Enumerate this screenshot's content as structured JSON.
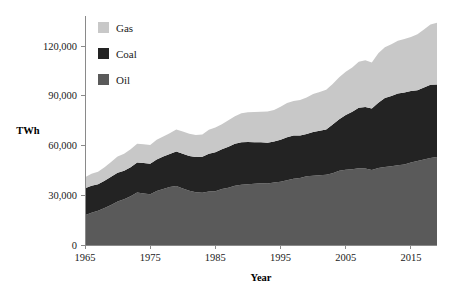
{
  "chart_data": {
    "type": "area",
    "stacked": true,
    "title": "",
    "xlabel": "Year",
    "ylabel": "TWh",
    "xlim": [
      1965,
      2019
    ],
    "ylim": [
      0,
      136000
    ],
    "xticks": [
      1965,
      1975,
      1985,
      1995,
      2005,
      2015
    ],
    "xtick_labels": [
      "1965",
      "1975",
      "1985",
      "1995",
      "2005",
      "2015"
    ],
    "yticks": [
      0,
      30000,
      60000,
      90000,
      120000
    ],
    "ytick_labels": [
      "0",
      "30,000",
      "60,000",
      "90,000",
      "120,000"
    ],
    "grid": false,
    "legend_position": "top-left",
    "legend_order": [
      "Gas",
      "Coal",
      "Oil"
    ],
    "stack_order_bottom_to_top": [
      "Oil",
      "Coal",
      "Gas"
    ],
    "colors": {
      "Gas": "#c8c8c8",
      "Coal": "#232323",
      "Oil": "#5a5a5a",
      "plot_background": "#ffffff",
      "axis": "#8a8a8a",
      "text": "#1a1a1a"
    },
    "x": [
      1965,
      1966,
      1967,
      1968,
      1969,
      1970,
      1971,
      1972,
      1973,
      1974,
      1975,
      1976,
      1977,
      1978,
      1979,
      1980,
      1981,
      1982,
      1983,
      1984,
      1985,
      1986,
      1987,
      1988,
      1989,
      1990,
      1991,
      1992,
      1993,
      1994,
      1995,
      1996,
      1997,
      1998,
      1999,
      2000,
      2001,
      2002,
      2003,
      2004,
      2005,
      2006,
      2007,
      2008,
      2009,
      2010,
      2011,
      2012,
      2013,
      2014,
      2015,
      2016,
      2017,
      2018,
      2019
    ],
    "series": [
      {
        "name": "Oil",
        "values": [
          18000,
          19400,
          20600,
          22300,
          24100,
          26200,
          27600,
          29400,
          31600,
          31100,
          30600,
          32500,
          33700,
          34900,
          35600,
          34100,
          32700,
          31800,
          31500,
          32300,
          32400,
          33700,
          34500,
          35700,
          36400,
          36700,
          36900,
          37200,
          37100,
          37700,
          38200,
          39100,
          40000,
          40400,
          41400,
          41800,
          42100,
          42400,
          43300,
          44800,
          45400,
          45700,
          46300,
          46100,
          45300,
          46500,
          47000,
          47500,
          48100,
          48500,
          49700,
          50600,
          51600,
          52400,
          53000
        ]
      },
      {
        "name": "Coal",
        "values": [
          16200,
          16400,
          16000,
          16400,
          17000,
          17400,
          17200,
          17500,
          18100,
          18300,
          18400,
          19100,
          19600,
          19900,
          20800,
          21000,
          21000,
          21200,
          21700,
          22700,
          23600,
          24000,
          24700,
          25300,
          25600,
          25400,
          25000,
          24700,
          24500,
          24700,
          25300,
          25800,
          26000,
          25700,
          25600,
          26400,
          26800,
          27200,
          29300,
          31100,
          33000,
          34700,
          36400,
          37100,
          37000,
          39300,
          41600,
          42300,
          43300,
          43500,
          43100,
          42700,
          43300,
          44200,
          43800
        ]
      },
      {
        "name": "Gas",
        "values": [
          6600,
          7100,
          7600,
          8200,
          9000,
          9700,
          10300,
          10900,
          11300,
          11400,
          11300,
          11900,
          12100,
          12600,
          13300,
          13400,
          13400,
          13400,
          13500,
          14500,
          14900,
          15100,
          16000,
          16700,
          17400,
          17900,
          18300,
          18500,
          18900,
          19000,
          19800,
          20800,
          20900,
          21300,
          22000,
          22900,
          23300,
          24000,
          24500,
          25300,
          26100,
          26700,
          27800,
          28200,
          27800,
          29800,
          30600,
          31300,
          31800,
          32200,
          32700,
          33800,
          35000,
          36300,
          37200
        ]
      }
    ]
  },
  "legend": {
    "items": [
      {
        "label": "Gas",
        "color": "#c8c8c8"
      },
      {
        "label": "Coal",
        "color": "#232323"
      },
      {
        "label": "Oil",
        "color": "#5a5a5a"
      }
    ]
  },
  "axes": {
    "y_title": "TWh",
    "x_title": "Year"
  }
}
